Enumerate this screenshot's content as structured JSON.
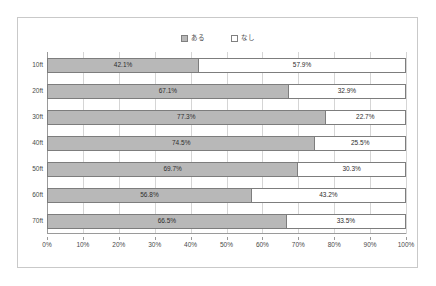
{
  "chart_data": {
    "type": "bar",
    "subtype": "horizontal-100pct-stacked",
    "title": "",
    "subtitle": "",
    "xlabel": "",
    "ylabel": "",
    "categories": [
      "10ft",
      "20ft",
      "30ft",
      "40ft",
      "50ft",
      "60ft",
      "70ft"
    ],
    "series": [
      {
        "name": "ある",
        "color": "#b8b8b8",
        "values": [
          42.1,
          67.1,
          77.3,
          74.5,
          69.7,
          56.8,
          66.5
        ],
        "labels": [
          "42.1%",
          "67.1%",
          "77.3%",
          "74.5%",
          "69.7%",
          "56.8%",
          "66.5%"
        ]
      },
      {
        "name": "なし",
        "color": "#ffffff",
        "values": [
          57.9,
          32.9,
          22.7,
          25.5,
          30.3,
          43.2,
          33.5
        ],
        "labels": [
          "57.9%",
          "32.9%",
          "22.7%",
          "25.5%",
          "30.3%",
          "43.2%",
          "33.5%"
        ]
      }
    ],
    "xlim": [
      0,
      100
    ],
    "xticks": [
      0,
      10,
      20,
      30,
      40,
      50,
      60,
      70,
      80,
      90,
      100
    ],
    "xticklabels": [
      "0%",
      "10%",
      "20%",
      "30%",
      "40%",
      "50%",
      "60%",
      "70%",
      "80%",
      "90%",
      "100%"
    ],
    "grid": "vertical",
    "legend_position": "top-center",
    "legend_entries": [
      "ある",
      "なし"
    ],
    "border_color": "#c9c9c9",
    "axis_color": "#9a9a9a",
    "gridline_color": "#d5d5d5",
    "bar_outline_color": "#7d7d7d"
  }
}
